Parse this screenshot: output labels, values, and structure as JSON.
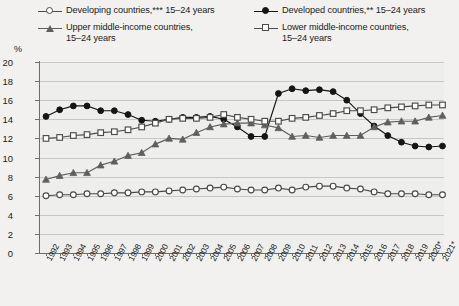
{
  "axis": {
    "y_unit": "%",
    "y_ticks": [
      "20",
      "18",
      "16",
      "14",
      "12",
      "10",
      "8",
      "6",
      "4",
      "2",
      "0"
    ],
    "x_labels": [
      "1992",
      "1993",
      "1994",
      "1995",
      "1996",
      "1997",
      "1998",
      "1999",
      "2000",
      "2001",
      "2002",
      "2003",
      "2004",
      "2005",
      "2006",
      "2007",
      "2008",
      "2009",
      "2010",
      "2011",
      "2012",
      "2013",
      "2014",
      "2015",
      "2016",
      "2017",
      "2018",
      "2019",
      "2020*",
      "2021*"
    ]
  },
  "legend": {
    "items": [
      {
        "label": "Developing countries,*** 15–24 years",
        "marker": "circle-open",
        "color": "#4a4a4a"
      },
      {
        "label": "Developed countries,** 15–24 years",
        "marker": "circle-filled",
        "color": "#151515"
      },
      {
        "label": "Upper middle-income countries,\n15–24 years",
        "marker": "triangle-filled",
        "color": "#5f5f5f"
      },
      {
        "label": "Lower middle-income countries,\n15–24 years",
        "marker": "square-open",
        "color": "#4a4a4a"
      }
    ]
  },
  "chart_data": {
    "type": "line",
    "title": "",
    "xlabel": "",
    "ylabel": "%",
    "ylim": [
      0,
      20
    ],
    "ytick_step": 2,
    "grid": true,
    "legend_position": "top",
    "x": [
      "1992",
      "1993",
      "1994",
      "1995",
      "1996",
      "1997",
      "1998",
      "1999",
      "2000",
      "2001",
      "2002",
      "2003",
      "2004",
      "2005",
      "2006",
      "2007",
      "2008",
      "2009",
      "2010",
      "2011",
      "2012",
      "2013",
      "2014",
      "2015",
      "2016",
      "2017",
      "2018",
      "2019",
      "2020*",
      "2021*"
    ],
    "series": [
      {
        "name": "Developing countries,*** 15–24 years",
        "marker": "circle-open",
        "color": "#4a4a4a",
        "values": [
          6.0,
          6.1,
          6.1,
          6.2,
          6.2,
          6.3,
          6.3,
          6.4,
          6.4,
          6.5,
          6.6,
          6.7,
          6.8,
          6.9,
          6.7,
          6.6,
          6.6,
          6.8,
          6.6,
          6.9,
          7.0,
          7.0,
          6.8,
          6.7,
          6.4,
          6.2,
          6.2,
          6.2,
          6.1,
          6.1
        ]
      },
      {
        "name": "Developed countries,** 15–24 years",
        "marker": "circle-filled",
        "color": "#151515",
        "values": [
          14.3,
          15.0,
          15.4,
          15.4,
          14.9,
          14.9,
          14.5,
          13.9,
          13.8,
          14.0,
          14.2,
          14.2,
          14.3,
          14.0,
          13.2,
          12.2,
          12.2,
          16.7,
          17.2,
          17.0,
          17.1,
          16.9,
          16.0,
          14.6,
          13.3,
          12.3,
          11.6,
          11.2,
          11.1,
          11.2
        ]
      },
      {
        "name": "Upper middle-income countries, 15–24 years",
        "marker": "triangle-filled",
        "color": "#5f5f5f",
        "values": [
          7.7,
          8.1,
          8.4,
          8.4,
          9.2,
          9.6,
          10.2,
          10.5,
          11.4,
          12.0,
          11.9,
          12.6,
          13.2,
          13.5,
          13.6,
          13.6,
          13.4,
          13.1,
          12.2,
          12.3,
          12.1,
          12.3,
          12.3,
          12.3,
          13.2,
          13.7,
          13.8,
          13.8,
          14.2,
          14.4
        ]
      },
      {
        "name": "Lower middle-income countries, 15–24 years",
        "marker": "square-open",
        "color": "#4a4a4a",
        "values": [
          12.0,
          12.1,
          12.3,
          12.4,
          12.6,
          12.7,
          12.9,
          13.2,
          13.6,
          14.0,
          14.1,
          14.1,
          14.2,
          14.5,
          14.2,
          14.0,
          13.8,
          13.8,
          14.1,
          14.2,
          14.4,
          14.6,
          14.9,
          14.9,
          15.0,
          15.2,
          15.3,
          15.4,
          15.5,
          15.5
        ]
      }
    ]
  }
}
